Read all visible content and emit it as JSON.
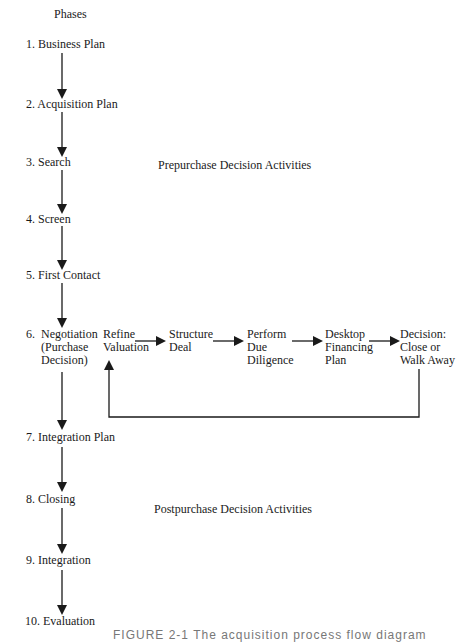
{
  "header": {
    "phases_label": "Phases"
  },
  "phases": [
    {
      "label": "1.  Business Plan"
    },
    {
      "label": "2.  Acquisition Plan"
    },
    {
      "label": "3.  Search"
    },
    {
      "label": "4.  Screen"
    },
    {
      "label": "5.  First Contact"
    },
    {
      "label": "6.  Negotiation\n     (Purchase\n     Decision)"
    },
    {
      "label": "7.  Integration Plan"
    },
    {
      "label": "8.  Closing"
    },
    {
      "label": "9.  Integration"
    },
    {
      "label": "10.  Evaluation"
    }
  ],
  "sections": {
    "prepurchase": "Prepurchase Decision Activities",
    "postpurchase": "Postpurchase Decision Activities"
  },
  "negotiation_steps": [
    {
      "label": "Refine\nValuation"
    },
    {
      "label": "Structure\nDeal"
    },
    {
      "label": "Perform\nDue\nDiligence"
    },
    {
      "label": "Desktop\nFinancing\nPlan"
    },
    {
      "label": "Decision:\nClose or\nWalk Away"
    }
  ],
  "caption": "FIGURE 2-1   The acquisition process flow diagram",
  "colors": {
    "line": "#1a1a1a",
    "text": "#1a1a1a"
  }
}
